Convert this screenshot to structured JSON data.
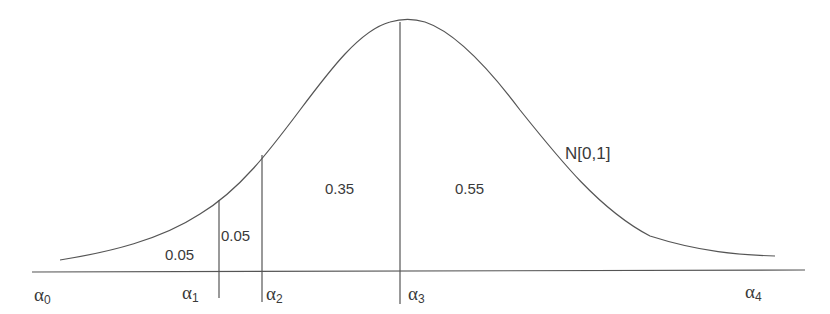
{
  "diagram": {
    "distribution_label": "N[0,1]",
    "area_labels": [
      "0.05",
      "0.05",
      "0.35",
      "0.55"
    ],
    "cut_points": [
      {
        "symbol": "α",
        "index": "0"
      },
      {
        "symbol": "α",
        "index": "1"
      },
      {
        "symbol": "α",
        "index": "2"
      },
      {
        "symbol": "α",
        "index": "3"
      },
      {
        "symbol": "α",
        "index": "4"
      }
    ],
    "line_color": "#555555",
    "text_color": "#3a3a3a"
  }
}
